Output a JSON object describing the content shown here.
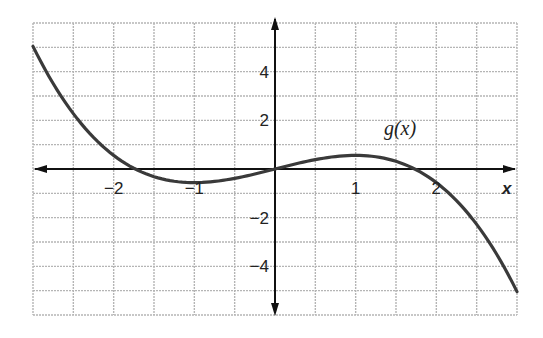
{
  "chart_data": {
    "type": "line",
    "title": "",
    "xlabel": "x",
    "ylabel": "",
    "xlim": [
      -3,
      3
    ],
    "ylim": [
      -6,
      6
    ],
    "grid": true,
    "grid_x_step": 0.5,
    "grid_y_step": 1,
    "x_ticks": [
      {
        "value": -2,
        "label": "−2"
      },
      {
        "value": -1,
        "label": "−1"
      },
      {
        "value": 1,
        "label": "1"
      },
      {
        "value": 2,
        "label": "2"
      }
    ],
    "y_ticks": [
      {
        "value": 4,
        "label": "4"
      },
      {
        "value": 2,
        "label": "2"
      },
      {
        "value": -2,
        "label": "−2"
      },
      {
        "value": -4,
        "label": "−4"
      }
    ],
    "series": [
      {
        "name": "g(x)",
        "label": "g(x)",
        "label_position": {
          "x": 1.35,
          "y": 1.7
        },
        "x": [
          -3,
          -2.5,
          -2,
          -1.73,
          -1.5,
          -1,
          -0.5,
          0,
          0.5,
          1,
          1.5,
          1.73,
          2,
          2.5,
          3
        ],
        "values": [
          5.04,
          2.28,
          0.56,
          0.0,
          -0.32,
          -0.56,
          -0.39,
          0.0,
          0.39,
          0.56,
          0.32,
          0.0,
          -0.56,
          -2.28,
          -5.04
        ]
      }
    ],
    "colors": {
      "curve": "#3a3a3a",
      "axes": "#111111",
      "grid": "#b5b5b5"
    }
  }
}
